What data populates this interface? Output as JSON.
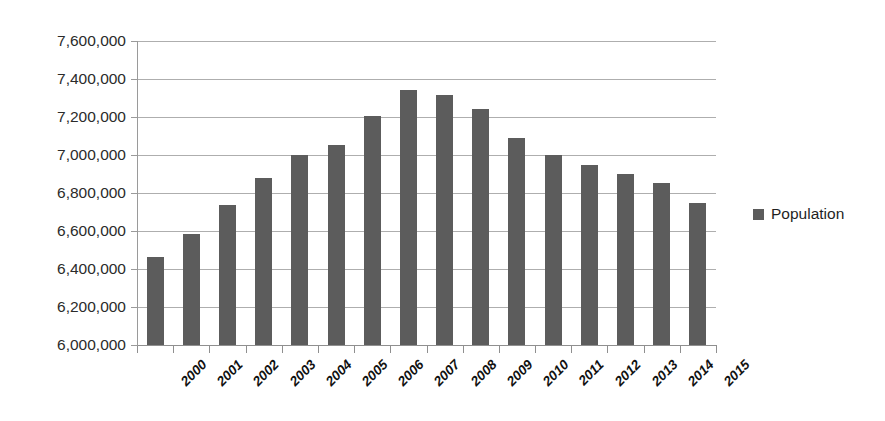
{
  "chart_data": {
    "type": "bar",
    "title": "",
    "xlabel": "",
    "ylabel": "",
    "categories": [
      "2000",
      "2001",
      "2002",
      "2003",
      "2004",
      "2005",
      "2006",
      "2007",
      "2008",
      "2009",
      "2010",
      "2011",
      "2012",
      "2013",
      "2014",
      "2015"
    ],
    "values": [
      6465000,
      6585000,
      6735000,
      6880000,
      7000000,
      7055000,
      7205000,
      7340000,
      7315000,
      7240000,
      7090000,
      7000000,
      6950000,
      6900000,
      6855000,
      6745000
    ],
    "series": [
      {
        "name": "Population",
        "values": [
          6465000,
          6585000,
          6735000,
          6880000,
          7000000,
          7055000,
          7205000,
          7340000,
          7315000,
          7240000,
          7090000,
          7000000,
          6950000,
          6900000,
          6855000,
          6745000
        ]
      }
    ],
    "ylim": [
      6000000,
      7600000
    ],
    "ytick_labels": [
      "7,600,000",
      "7,400,000",
      "7,200,000",
      "7,000,000",
      "6,800,000",
      "6,600,000",
      "6,400,000",
      "6,200,000",
      "6,000,000"
    ],
    "ytick_values": [
      7600000,
      7400000,
      7200000,
      7000000,
      6800000,
      6600000,
      6400000,
      6200000,
      6000000
    ],
    "ytick_step": 200000,
    "grid": true,
    "grid_axis": "y",
    "legend_position": "right",
    "bar_color": "#5c5c5c",
    "grid_color": "#aeaeae",
    "axis_color": "#8f8f8f",
    "x_label_rotation": -45
  },
  "legend": {
    "entries": [
      {
        "label": "Population",
        "color": "#5c5c5c",
        "marker": "square"
      }
    ]
  }
}
